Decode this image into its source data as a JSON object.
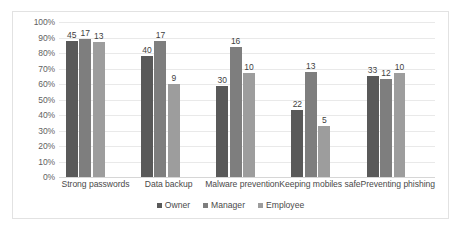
{
  "chart_data": {
    "type": "bar",
    "title": "",
    "subtitle": "",
    "xlabel": "",
    "ylabel": "",
    "ylim": [
      0,
      100
    ],
    "ytick_labels": [
      "100%",
      "90%",
      "80%",
      "70%",
      "60%",
      "50%",
      "40%",
      "30%",
      "20%",
      "10%",
      "0%"
    ],
    "ytick_values": [
      100,
      90,
      80,
      70,
      60,
      50,
      40,
      30,
      20,
      10,
      0
    ],
    "grid": true,
    "legend_position": "bottom",
    "value_label_kind": "count",
    "categories": [
      "Strong passwords",
      "Data backup",
      "Malware prevention",
      "Keeping mobiles safe",
      "Preventing phishing"
    ],
    "series": [
      {
        "name": "Owner",
        "color": "#595959",
        "values": [
          88,
          78,
          59,
          43,
          65
        ],
        "labels": [
          "45",
          "40",
          "30",
          "22",
          "33"
        ]
      },
      {
        "name": "Manager",
        "color": "#7e7e7e",
        "values": [
          89,
          88,
          84,
          68,
          63
        ],
        "labels": [
          "17",
          "17",
          "16",
          "13",
          "12"
        ]
      },
      {
        "name": "Employee",
        "color": "#9d9d9d",
        "values": [
          87,
          60,
          67,
          33,
          67
        ],
        "labels": [
          "13",
          "9",
          "10",
          "5",
          "10"
        ]
      }
    ]
  }
}
